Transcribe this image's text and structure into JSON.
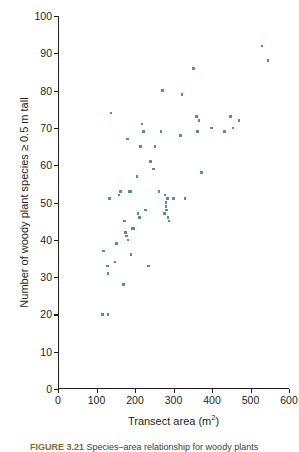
{
  "figure": {
    "caption_label": "FIGURE 3.21",
    "caption_text": "Species–area relationship for woody plants"
  },
  "chart_data": {
    "type": "scatter",
    "title": "",
    "xlabel": "Transect area (m2)",
    "xlabel_base": "Transect area (m",
    "xlabel_exponent": "2",
    "xlabel_suffix": ")",
    "ylabel": "Number of woody plant species ≥ 0.5 m tall",
    "xlim": [
      0,
      600
    ],
    "ylim": [
      0,
      100
    ],
    "xticks": [
      0,
      100,
      200,
      300,
      400,
      500,
      600
    ],
    "yticks": [
      0,
      10,
      20,
      30,
      40,
      50,
      60,
      70,
      80,
      90,
      100
    ],
    "grid": false,
    "legend": false,
    "marker_color": "#5c8f85",
    "axis_color": "#231f20",
    "series": [
      {
        "name": "transects",
        "points": [
          [
            115,
            20
          ],
          [
            130,
            20
          ],
          [
            118,
            37
          ],
          [
            128,
            33
          ],
          [
            130,
            31
          ],
          [
            133,
            51
          ],
          [
            138,
            74
          ],
          [
            148,
            34
          ],
          [
            152,
            39
          ],
          [
            158,
            52
          ],
          [
            163,
            53
          ],
          [
            170,
            28
          ],
          [
            172,
            45
          ],
          [
            176,
            42
          ],
          [
            178,
            41
          ],
          [
            180,
            67
          ],
          [
            182,
            40
          ],
          [
            184,
            53
          ],
          [
            188,
            53
          ],
          [
            190,
            36
          ],
          [
            193,
            43
          ],
          [
            196,
            43
          ],
          [
            205,
            57
          ],
          [
            208,
            47
          ],
          [
            212,
            46
          ],
          [
            215,
            65
          ],
          [
            218,
            71
          ],
          [
            222,
            69
          ],
          [
            228,
            48
          ],
          [
            235,
            33
          ],
          [
            240,
            61
          ],
          [
            248,
            59
          ],
          [
            252,
            65
          ],
          [
            262,
            53
          ],
          [
            268,
            69
          ],
          [
            272,
            80
          ],
          [
            276,
            47
          ],
          [
            278,
            52
          ],
          [
            280,
            50
          ],
          [
            281,
            49
          ],
          [
            282,
            48
          ],
          [
            284,
            51
          ],
          [
            286,
            46
          ],
          [
            288,
            45
          ],
          [
            300,
            51
          ],
          [
            318,
            68
          ],
          [
            322,
            79
          ],
          [
            330,
            51
          ],
          [
            352,
            86
          ],
          [
            360,
            73
          ],
          [
            362,
            69
          ],
          [
            366,
            72
          ],
          [
            372,
            58
          ],
          [
            398,
            70
          ],
          [
            432,
            69
          ],
          [
            448,
            73
          ],
          [
            455,
            70
          ],
          [
            470,
            72
          ],
          [
            530,
            92
          ],
          [
            545,
            88
          ]
        ]
      }
    ]
  }
}
